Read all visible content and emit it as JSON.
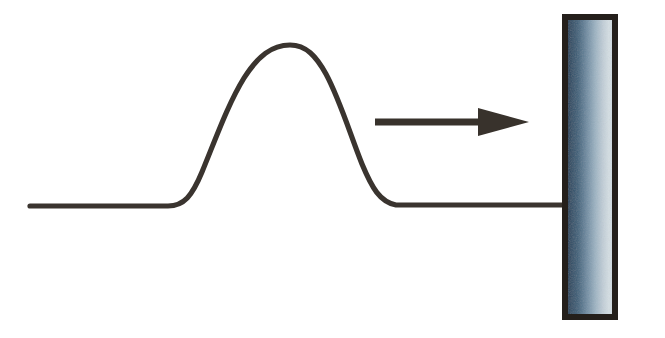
{
  "figure": {
    "title": "Transverse wave pulse travelling along a string toward a rigid wall",
    "width": 665,
    "height": 338,
    "background_color": "#ffffff"
  },
  "colors": {
    "string": "#3a342f",
    "arrow": "#38322c",
    "wall_border": "#241f1b",
    "wall_gradient_left": "#2b4a63",
    "wall_gradient_mid": "#7e98ac",
    "wall_gradient_right": "#d2dce2",
    "background": "#ffffff"
  },
  "elements": {
    "string": {
      "label": "string-with-pulse",
      "stroke_width": 5.2,
      "baseline_y": 206,
      "left_end_x": 30,
      "right_end_x": 566,
      "pulse_peak_x": 290,
      "pulse_peak_y": 45,
      "pulse_start_x": 178,
      "pulse_end_x": 392,
      "path": "M 30,206 L 168,206 C 184,206 192,196 202,172 C 216,138 228,104 244,78 C 258,56 272,45 290,45 C 306,45 316,56 326,74 C 340,100 350,134 362,164 C 372,188 380,202 396,205 L 566,205"
    },
    "direction_arrow": {
      "label": "propagation-direction-arrow",
      "shaft_x1": 375,
      "shaft_x2": 484,
      "shaft_y": 122,
      "shaft_thickness": 7,
      "head_tip_x": 529,
      "head_back_x": 478,
      "head_half_height": 14,
      "points_toward": "wall"
    },
    "wall": {
      "label": "fixed-end-wall",
      "x": 562,
      "y": 14,
      "width": 56,
      "height": 306,
      "border_width": 6,
      "fill_style": "horizontal-gradient"
    }
  },
  "labels": {
    "string": "string",
    "pulse": "wave pulse",
    "arrow": "direction of travel",
    "wall": "fixed end (wall)"
  }
}
